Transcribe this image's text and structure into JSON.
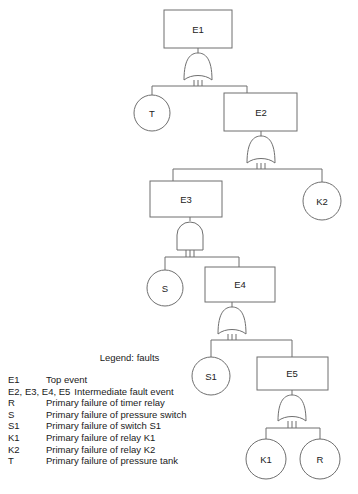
{
  "diagram": {
    "type": "fault-tree",
    "nodes": [
      {
        "id": "E1",
        "label": "E1",
        "shape": "rect",
        "x": 164,
        "y": 10,
        "w": 68,
        "h": 38
      },
      {
        "id": "T",
        "label": "T",
        "shape": "circle",
        "cx": 152,
        "cy": 113,
        "r": 18
      },
      {
        "id": "E2",
        "label": "E2",
        "shape": "rect",
        "x": 224,
        "y": 93,
        "w": 73,
        "h": 38
      },
      {
        "id": "E3",
        "label": "E3",
        "shape": "rect",
        "x": 150,
        "y": 181,
        "w": 72,
        "h": 36
      },
      {
        "id": "K2",
        "label": "K2",
        "shape": "circle",
        "cx": 322,
        "cy": 201,
        "r": 19
      },
      {
        "id": "S",
        "label": "S",
        "shape": "circle",
        "cx": 165,
        "cy": 288,
        "r": 18
      },
      {
        "id": "E4",
        "label": "E4",
        "shape": "rect",
        "x": 205,
        "y": 267,
        "w": 70,
        "h": 35
      },
      {
        "id": "S1",
        "label": "S1",
        "shape": "circle",
        "cx": 211,
        "cy": 376,
        "r": 19
      },
      {
        "id": "E5",
        "label": "E5",
        "shape": "rect",
        "x": 257,
        "y": 357,
        "w": 71,
        "h": 33
      },
      {
        "id": "K1",
        "label": "K1",
        "shape": "circle",
        "cx": 266,
        "cy": 459,
        "r": 20
      },
      {
        "id": "R",
        "label": "R",
        "shape": "circle",
        "cx": 320,
        "cy": 459,
        "r": 20
      }
    ],
    "gates": [
      {
        "id": "G1",
        "type": "or",
        "parent": "E1",
        "children": [
          "T",
          "E2"
        ]
      },
      {
        "id": "G2",
        "type": "or",
        "parent": "E2",
        "children": [
          "E3",
          "K2"
        ]
      },
      {
        "id": "G3",
        "type": "and",
        "parent": "E3",
        "children": [
          "S",
          "E4"
        ]
      },
      {
        "id": "G4",
        "type": "or",
        "parent": "E4",
        "children": [
          "S1",
          "E5"
        ]
      },
      {
        "id": "G5",
        "type": "or",
        "parent": "E5",
        "children": [
          "K1",
          "R"
        ]
      }
    ]
  },
  "legend": {
    "title": "Legend: faults",
    "entries": [
      {
        "key": "E1",
        "desc": "Top event",
        "wide": false
      },
      {
        "key": "E2, E3, E4, E5",
        "desc": "Intermediate fault event",
        "wide": true
      },
      {
        "key": "R",
        "desc": "Primary failure of timer relay",
        "wide": false
      },
      {
        "key": "S",
        "desc": "Primary failure of pressure switch",
        "wide": false
      },
      {
        "key": "S1",
        "desc": "Primary failure of switch S1",
        "wide": false
      },
      {
        "key": "K1",
        "desc": "Primary failure of relay K1",
        "wide": false
      },
      {
        "key": "K2",
        "desc": "Primary failure of relay K2",
        "wide": false
      },
      {
        "key": "T",
        "desc": "Primary failure of pressure tank",
        "wide": false
      }
    ]
  },
  "colors": {
    "stroke": "#6f6f6f",
    "text": "#1a1a1a",
    "background": "#ffffff"
  }
}
